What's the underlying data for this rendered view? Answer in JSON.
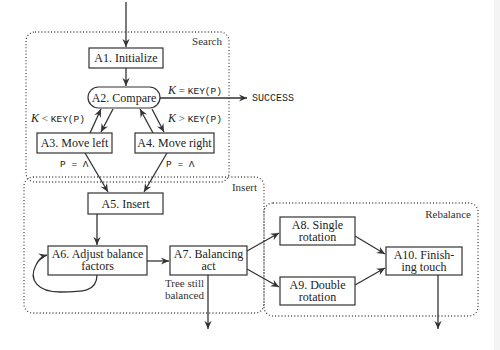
{
  "diagram": {
    "type": "flowchart",
    "regions": [
      {
        "id": "search",
        "label": "Search"
      },
      {
        "id": "insert",
        "label": "Insert"
      },
      {
        "id": "rebalance",
        "label": "Rebalance"
      }
    ],
    "nodes": {
      "a1": {
        "label": "A1. Initialize"
      },
      "a2": {
        "label": "A2. Compare"
      },
      "a3": {
        "label": "A3. Move left"
      },
      "a4": {
        "label": "A4. Move right"
      },
      "a5": {
        "label": "A5. Insert"
      },
      "a6": {
        "line1": "A6. Adjust balance",
        "line2": "factors"
      },
      "a7": {
        "line1": "A7. Balancing",
        "line2": "act"
      },
      "a8": {
        "line1": "A8. Single",
        "line2": "rotation"
      },
      "a9": {
        "line1": "A9. Double",
        "line2": "rotation"
      },
      "a10": {
        "line1": "A10. Finish-",
        "line2": "ing touch"
      }
    },
    "edge_labels": {
      "eq_k": "K",
      "eq_op": " = ",
      "eq_key": "KEY(P)",
      "lt_k": "K",
      "lt_op": " < ",
      "lt_key": "KEY(P)",
      "gt_k": "K",
      "gt_op": " > ",
      "gt_key": "KEY(P)",
      "p_null_left": "P = Λ",
      "p_null_right": "P = Λ",
      "success": "SUCCESS",
      "tree_balanced_line1": "Tree still",
      "tree_balanced_line2": "balanced"
    },
    "edges": [
      {
        "from": "start",
        "to": "a1"
      },
      {
        "from": "a1",
        "to": "a2"
      },
      {
        "from": "a2",
        "to": "success",
        "label": "K = KEY(P)"
      },
      {
        "from": "a2",
        "to": "a3",
        "label": "K < KEY(P)"
      },
      {
        "from": "a3",
        "to": "a2"
      },
      {
        "from": "a2",
        "to": "a4",
        "label": "K > KEY(P)"
      },
      {
        "from": "a4",
        "to": "a2"
      },
      {
        "from": "a3",
        "to": "a5",
        "label": "P = Λ"
      },
      {
        "from": "a4",
        "to": "a5",
        "label": "P = Λ"
      },
      {
        "from": "a5",
        "to": "a6"
      },
      {
        "from": "a6",
        "to": "a6"
      },
      {
        "from": "a6",
        "to": "a7"
      },
      {
        "from": "a7",
        "to": "a8"
      },
      {
        "from": "a7",
        "to": "a9"
      },
      {
        "from": "a7",
        "to": "exit",
        "label": "Tree still balanced"
      },
      {
        "from": "a8",
        "to": "a10"
      },
      {
        "from": "a9",
        "to": "a10"
      },
      {
        "from": "a10",
        "to": "exit"
      }
    ]
  }
}
